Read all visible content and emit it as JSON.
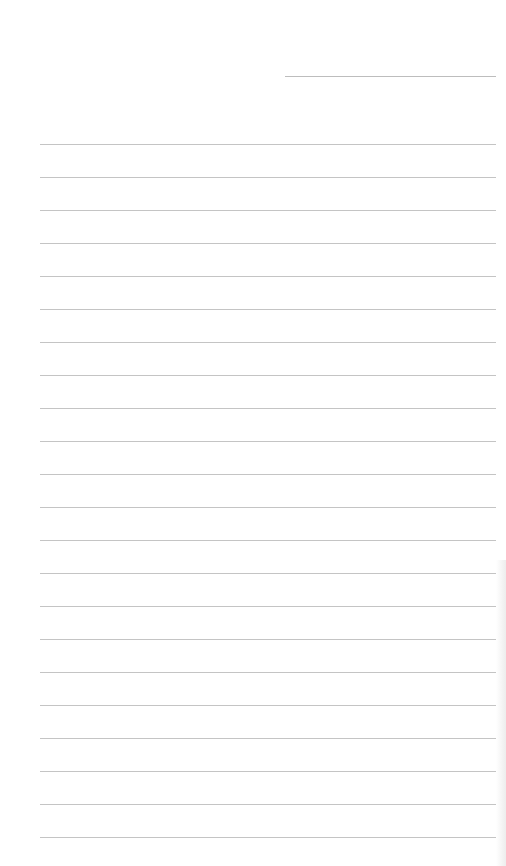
{
  "page": {
    "type": "blank lined paper",
    "header_line": {
      "x_start": 285,
      "x_end": 496,
      "y": 76
    },
    "ruled_lines": {
      "count": 22,
      "x_start": 40,
      "x_end": 496,
      "first_y": 144,
      "spacing": 33
    },
    "line_color": "#c4c4c4",
    "background_color": "#ffffff"
  }
}
